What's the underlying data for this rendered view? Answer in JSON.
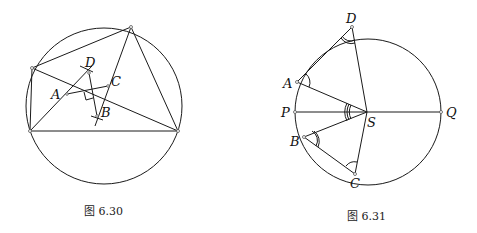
{
  "figures": [
    {
      "caption": "图 6.30",
      "labels": {
        "A": "A",
        "B": "B",
        "C": "C",
        "D": "D"
      }
    },
    {
      "caption": "图 6.31",
      "labels": {
        "A": "A",
        "B": "B",
        "C": "C",
        "D": "D",
        "P": "P",
        "Q": "Q",
        "S": "S"
      }
    }
  ]
}
